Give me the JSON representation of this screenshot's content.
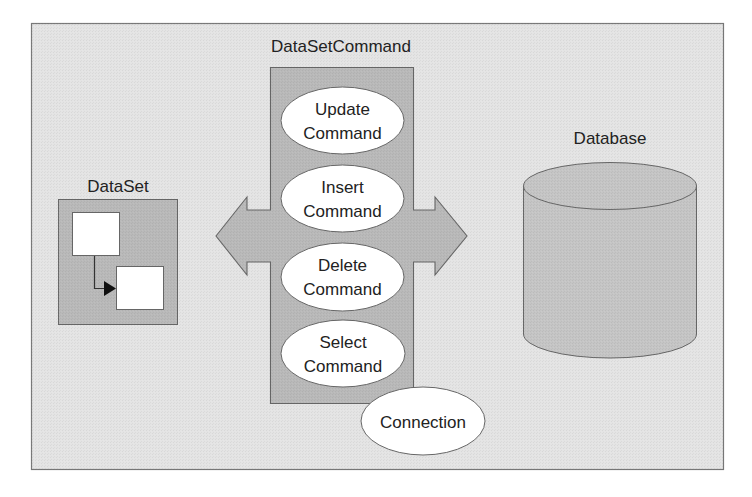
{
  "diagram": {
    "colors": {
      "page": "#ffffff",
      "frame_fill": "#e4e4e4",
      "frame_stroke": "#777777",
      "panel_fill": "#b9b9b9",
      "panel_stroke": "#666666",
      "cylinder_fill": "#c5c5c5",
      "ellipse_fill": "#ffffff",
      "text": "#222222"
    },
    "dataset": {
      "title": "DataSet"
    },
    "dataset_command": {
      "title": "DataSetCommand",
      "commands": [
        {
          "line1": "Update",
          "line2": "Command"
        },
        {
          "line1": "Insert",
          "line2": "Command"
        },
        {
          "line1": "Delete",
          "line2": "Command"
        },
        {
          "line1": "Select",
          "line2": "Command"
        }
      ],
      "connection": "Connection"
    },
    "database": {
      "title": "Database"
    }
  }
}
